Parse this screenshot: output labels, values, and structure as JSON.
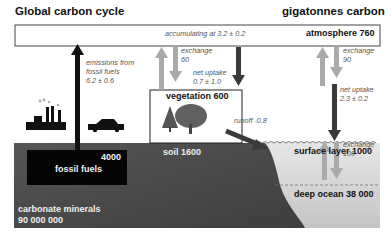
{
  "header": {
    "title": "Global carbon cycle",
    "units": "gigatonnes carbon"
  },
  "reservoirs": {
    "atmosphere": "atmosphere 760",
    "vegetation": "vegetation 600",
    "soil": "soil 1600",
    "surface_layer": "surface layer 1000",
    "deep_ocean": "deep ocean 38 000",
    "fossil_fuels_value": "4000",
    "fossil_fuels_label": "fossil fuels",
    "carbonate_label": "carbonate minerals",
    "carbonate_value": "90 000 000"
  },
  "fluxes": {
    "accumulating": "accumulating at 3.2 ± 0.2",
    "emissions": [
      "emissions from",
      "fossil fuels",
      "6.2 ± 0.6"
    ],
    "veg_exchange": [
      "exchange",
      "60"
    ],
    "veg_net_uptake": [
      "net uptake",
      "0.7 ± 1.0"
    ],
    "ocean_exchange": [
      "exchange",
      "90"
    ],
    "ocean_net_uptake": [
      "net uptake",
      "2.3 ± 0.2"
    ],
    "runoff": "runoff -0.8",
    "deep_exchange": [
      "exchange",
      "100"
    ]
  },
  "colors": {
    "dark_arrow": "#3a3a3a",
    "light_arrow": "#aaaaaa",
    "ground": "#4a4a4a",
    "ocean": "#dcdcdc",
    "fossil_box": "#050505"
  }
}
